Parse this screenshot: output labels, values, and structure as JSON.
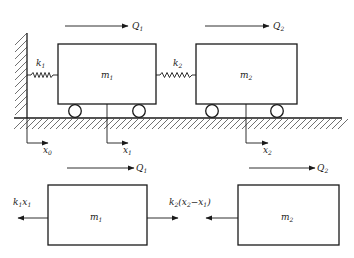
{
  "diagram": {
    "colors": {
      "line": "#1a1a1a",
      "background": "#ffffff"
    },
    "system": {
      "masses": [
        {
          "id": "m1",
          "label": "m",
          "sub": "1"
        },
        {
          "id": "m2",
          "label": "m",
          "sub": "2"
        }
      ],
      "springs": [
        {
          "id": "k1",
          "label": "k",
          "sub": "1"
        },
        {
          "id": "k2",
          "label": "k",
          "sub": "2"
        }
      ],
      "forces": [
        {
          "id": "Q1",
          "label": "Q",
          "sub": "1"
        },
        {
          "id": "Q2",
          "label": "Q",
          "sub": "2"
        }
      ],
      "coordinates": [
        {
          "id": "x0",
          "label": "x",
          "sub": "0"
        },
        {
          "id": "x1",
          "label": "x",
          "sub": "1"
        },
        {
          "id": "x2",
          "label": "x",
          "sub": "2"
        }
      ]
    },
    "free_body": {
      "masses": [
        {
          "id": "m1",
          "label": "m",
          "sub": "1"
        },
        {
          "id": "m2",
          "label": "m",
          "sub": "2"
        }
      ],
      "forces": [
        {
          "id": "Q1",
          "label": "Q",
          "sub": "1"
        },
        {
          "id": "Q2",
          "label": "Q",
          "sub": "2"
        }
      ],
      "spring_forces": [
        {
          "id": "k1x1",
          "k": "k",
          "ksub": "1",
          "x": "x",
          "xsub": "1"
        },
        {
          "id": "k2x2x1",
          "k": "k",
          "ksub": "2",
          "open": "(",
          "x2": "x",
          "x2sub": "2",
          "minus": "−",
          "x1": "x",
          "x1sub": "1",
          "close": ")"
        }
      ]
    }
  }
}
